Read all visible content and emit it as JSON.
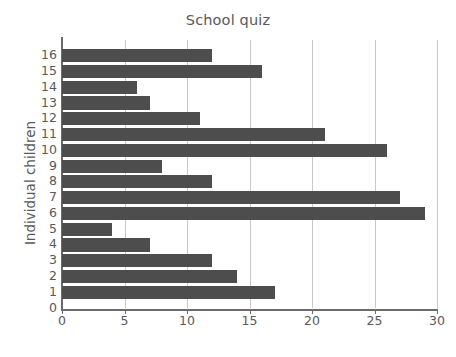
{
  "top_clipped_text": "",
  "chart_data": {
    "type": "bar",
    "orientation": "horizontal",
    "title": "School quiz",
    "xlabel": "Number of questions answered correctly",
    "ylabel": "Individual children",
    "categories": [
      "1",
      "2",
      "3",
      "4",
      "5",
      "6",
      "7",
      "8",
      "9",
      "10",
      "11",
      "12",
      "13",
      "14",
      "15",
      "16"
    ],
    "values": [
      17,
      14,
      12,
      7,
      4,
      29,
      27,
      12,
      8,
      26,
      21,
      11,
      7,
      6,
      16,
      12
    ],
    "xlim": [
      0,
      30
    ],
    "xticks": [
      0,
      5,
      10,
      15,
      20,
      25,
      30
    ],
    "ytick_labels": [
      "0",
      "1",
      "2",
      "3",
      "4",
      "5",
      "6",
      "7",
      "8",
      "9",
      "10",
      "11",
      "12",
      "13",
      "14",
      "15",
      "16"
    ],
    "grid": "vertical",
    "legend": "none",
    "bar_color": "#4d4d4d",
    "grid_color": "#c9c9c9",
    "axis_color": "#6b6b6b",
    "text_color": "#58595b",
    "background": "#ffffff"
  }
}
